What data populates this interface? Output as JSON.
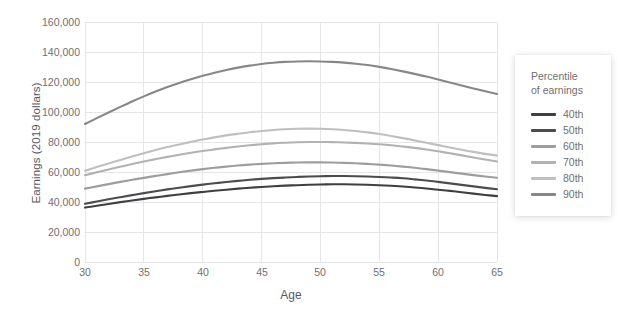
{
  "chart_data": {
    "type": "line",
    "title": "",
    "xlabel": "Age",
    "ylabel": "Earnings (2019 dollars)",
    "xlim": [
      30,
      65
    ],
    "ylim": [
      0,
      160000
    ],
    "grid": true,
    "legend_position": "right",
    "legend_title_line1": "Percentile",
    "legend_title_line2": "of earnings",
    "x_ticks": [
      "30",
      "35",
      "40",
      "45",
      "50",
      "55",
      "60",
      "65"
    ],
    "y_ticks": [
      "0",
      "20,000",
      "40,000",
      "60,000",
      "80,000",
      "100,000",
      "120,000",
      "140,000",
      "160,000"
    ],
    "x": [
      30,
      31,
      32,
      33,
      34,
      35,
      36,
      37,
      38,
      39,
      40,
      41,
      42,
      43,
      44,
      45,
      46,
      47,
      48,
      49,
      50,
      51,
      52,
      53,
      54,
      55,
      56,
      57,
      58,
      59,
      60,
      61,
      62,
      63,
      64,
      65
    ],
    "series": [
      {
        "name": "40th",
        "color": "#3f3f41",
        "values": [
          36300,
          37500,
          38700,
          39900,
          41000,
          42100,
          43100,
          44100,
          45000,
          45900,
          46700,
          47500,
          48200,
          48900,
          49500,
          50000,
          50500,
          50900,
          51200,
          51500,
          51700,
          51800,
          51800,
          51700,
          51500,
          51200,
          50800,
          50300,
          49700,
          49000,
          48200,
          47400,
          46500,
          45600,
          44700,
          43900
        ]
      },
      {
        "name": "50th",
        "color": "#4c4c4f",
        "values": [
          38800,
          40300,
          41800,
          43200,
          44600,
          45900,
          47200,
          48400,
          49500,
          50600,
          51600,
          52500,
          53300,
          54100,
          54800,
          55400,
          55900,
          56300,
          56700,
          57000,
          57200,
          57300,
          57300,
          57200,
          57000,
          56700,
          56300,
          55800,
          55100,
          54300,
          53400,
          52400,
          51400,
          50400,
          49400,
          48500
        ]
      },
      {
        "name": "60th",
        "color": "#9d9da0",
        "values": [
          48900,
          50400,
          51900,
          53400,
          54800,
          56100,
          57400,
          58600,
          59800,
          60900,
          61900,
          62800,
          63600,
          64300,
          64900,
          65400,
          65800,
          66100,
          66300,
          66400,
          66400,
          66300,
          66100,
          65800,
          65400,
          64900,
          64300,
          63600,
          62800,
          61900,
          60900,
          59900,
          58900,
          57900,
          57000,
          56200
        ]
      },
      {
        "name": "70th",
        "color": "#b2b2b5",
        "values": [
          57900,
          59800,
          61700,
          63500,
          65300,
          67000,
          68600,
          70100,
          71500,
          72800,
          74000,
          75100,
          76100,
          77000,
          77800,
          78500,
          79100,
          79500,
          79800,
          80000,
          80000,
          79900,
          79700,
          79400,
          79000,
          78500,
          77800,
          77000,
          76100,
          75000,
          73800,
          72500,
          71100,
          69700,
          68300,
          67000
        ]
      },
      {
        "name": "80th",
        "color": "#bfbfc2",
        "values": [
          60900,
          63300,
          65700,
          68000,
          70300,
          72500,
          74600,
          76600,
          78400,
          80100,
          81700,
          83100,
          84400,
          85500,
          86500,
          87300,
          88000,
          88500,
          88800,
          88900,
          88800,
          88500,
          88000,
          87300,
          86400,
          85300,
          84000,
          82600,
          81100,
          79500,
          77900,
          76300,
          74800,
          73400,
          72100,
          71000
        ]
      },
      {
        "name": "90th",
        "color": "#87878a",
        "values": [
          92000,
          95900,
          99700,
          103400,
          107000,
          110400,
          113600,
          116600,
          119300,
          121800,
          124100,
          126200,
          128000,
          129600,
          130900,
          132000,
          132800,
          133400,
          133700,
          133800,
          133700,
          133400,
          132900,
          132200,
          131300,
          130100,
          128700,
          127100,
          125400,
          123600,
          121700,
          119700,
          117700,
          115700,
          113800,
          112000
        ]
      }
    ]
  }
}
